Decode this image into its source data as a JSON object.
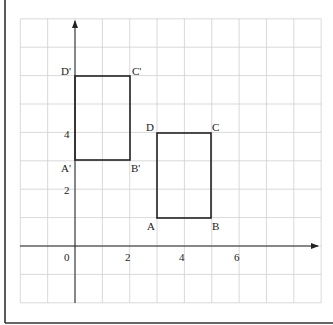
{
  "diagram": {
    "type": "coordinate-grid-translation",
    "colors": {
      "grid": "#cfcfcf",
      "axis": "#222222",
      "shape": "#222222",
      "frame": "#333333",
      "background": "#ffffff"
    },
    "grid": {
      "x_min": -2,
      "x_max": 9,
      "y_min": -2,
      "y_max": 8
    },
    "axes": {
      "x_tick_labels": [
        {
          "value": 0,
          "text": "0"
        },
        {
          "value": 2,
          "text": "2"
        },
        {
          "value": 4,
          "text": "4"
        },
        {
          "value": 6,
          "text": "6"
        }
      ],
      "y_tick_labels": [
        {
          "value": 2,
          "text": "2"
        },
        {
          "value": 4,
          "text": "4"
        }
      ]
    },
    "shapes": [
      {
        "name": "rectangle-ABCD",
        "vertices": [
          {
            "label": "A",
            "x": 3,
            "y": 1
          },
          {
            "label": "B",
            "x": 5,
            "y": 1
          },
          {
            "label": "C",
            "x": 5,
            "y": 4
          },
          {
            "label": "D",
            "x": 3,
            "y": 4
          }
        ]
      },
      {
        "name": "rectangle-A'B'C'D'",
        "vertices": [
          {
            "label": "A'",
            "x": 0,
            "y": 3
          },
          {
            "label": "B'",
            "x": 2,
            "y": 3
          },
          {
            "label": "C'",
            "x": 2,
            "y": 6
          },
          {
            "label": "D'",
            "x": 0,
            "y": 6
          }
        ]
      }
    ],
    "labels": {
      "origin": "0",
      "x2": "2",
      "x4": "4",
      "x6": "6",
      "y2": "2",
      "y4": "4",
      "A": "A",
      "B": "B",
      "C": "C",
      "D": "D",
      "A_prime": "A'",
      "B_prime": "B'",
      "C_prime": "C'",
      "D_prime": "D'"
    }
  }
}
